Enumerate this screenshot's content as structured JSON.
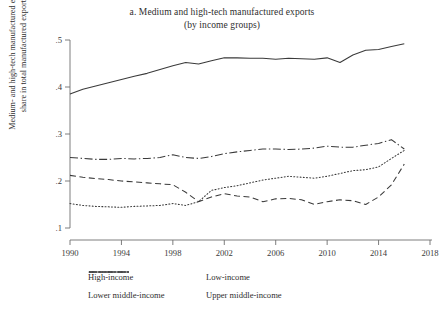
{
  "title": {
    "line1": "a. Medium and high-tech manufactured exports",
    "line2": "(by income groups)"
  },
  "axes": {
    "ylabel_line1": "Medium- and high-tech manufactured exports",
    "ylabel_line2": "share in total manufactured exports",
    "xlabel": "",
    "yticks": [
      ".1",
      ".2",
      ".3",
      ".4",
      ".5"
    ],
    "xticks": [
      "1990",
      "1994",
      "1998",
      "2002",
      "2006",
      "2010",
      "2014",
      "2018"
    ]
  },
  "legend": {
    "high_income": "High-income",
    "low_income": "Low-income",
    "lower_middle_income": "Lower middle-income",
    "upper_middle_income": "Upper middle-income"
  },
  "chart_data": {
    "type": "line",
    "title": "a. Medium and high-tech manufactured exports (by income groups)",
    "xlabel": "",
    "ylabel": "Medium- and high-tech manufactured exports share in total manufactured exports",
    "xlim": [
      1990,
      2018
    ],
    "ylim": [
      0.1,
      0.5
    ],
    "yticks": [
      0.1,
      0.2,
      0.3,
      0.4,
      0.5
    ],
    "xticks": [
      1990,
      1994,
      1998,
      2002,
      2006,
      2010,
      2014,
      2018
    ],
    "grid": false,
    "legend_position": "bottom",
    "x": [
      1990,
      1991,
      1992,
      1993,
      1994,
      1995,
      1996,
      1997,
      1998,
      1999,
      2000,
      2001,
      2002,
      2003,
      2004,
      2005,
      2006,
      2007,
      2008,
      2009,
      2010,
      2011,
      2012,
      2013,
      2014,
      2015,
      2016
    ],
    "series": [
      {
        "name": "High-income",
        "style": "solid",
        "color": "#3a3a3a",
        "values": [
          0.385,
          0.395,
          0.402,
          0.409,
          0.416,
          0.423,
          0.429,
          0.437,
          0.445,
          0.452,
          0.449,
          0.456,
          0.462,
          0.462,
          0.461,
          0.461,
          0.459,
          0.461,
          0.46,
          0.459,
          0.462,
          0.452,
          0.468,
          0.478,
          0.48,
          0.486,
          0.492
        ]
      },
      {
        "name": "Low-income",
        "style": "dashed",
        "color": "#3a3a3a",
        "values": [
          0.212,
          0.208,
          0.205,
          0.203,
          0.2,
          0.198,
          0.196,
          0.194,
          0.192,
          0.176,
          0.156,
          0.166,
          0.173,
          0.168,
          0.166,
          0.156,
          0.162,
          0.163,
          0.16,
          0.15,
          0.156,
          0.16,
          0.158,
          0.15,
          0.166,
          0.192,
          0.236
        ]
      },
      {
        "name": "Lower middle-income",
        "style": "dotted",
        "color": "#3a3a3a",
        "values": [
          0.152,
          0.148,
          0.146,
          0.145,
          0.144,
          0.146,
          0.147,
          0.148,
          0.152,
          0.148,
          0.156,
          0.18,
          0.186,
          0.19,
          0.196,
          0.202,
          0.206,
          0.21,
          0.208,
          0.206,
          0.21,
          0.216,
          0.222,
          0.224,
          0.23,
          0.248,
          0.265
        ]
      },
      {
        "name": "Upper middle-income",
        "style": "dashdot",
        "color": "#3a3a3a",
        "values": [
          0.25,
          0.248,
          0.246,
          0.246,
          0.248,
          0.247,
          0.248,
          0.25,
          0.256,
          0.25,
          0.248,
          0.252,
          0.258,
          0.262,
          0.265,
          0.268,
          0.268,
          0.267,
          0.268,
          0.27,
          0.274,
          0.272,
          0.272,
          0.276,
          0.28,
          0.288,
          0.268
        ]
      }
    ]
  }
}
